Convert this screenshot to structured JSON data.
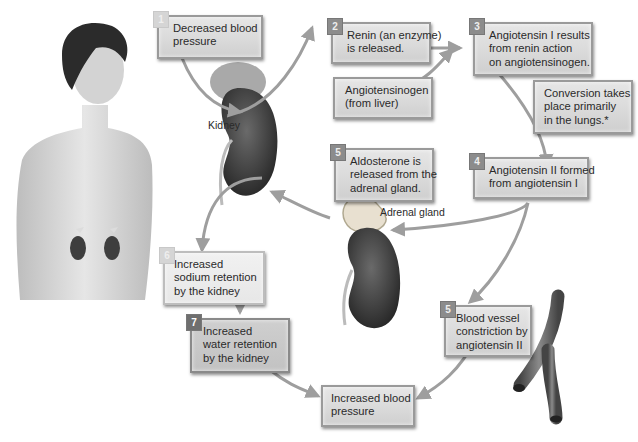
{
  "diagram": {
    "colors": {
      "box_fill": "#d9d9d9",
      "box_border": "#9a9a9a",
      "badge": "#8c8c8c",
      "arrow": "#9e9e9e",
      "text": "#2a2a2a",
      "kidney": "#3a3a3a"
    },
    "steps": [
      {
        "id": "s1",
        "number": "1",
        "lines": [
          "Decreased blood",
          "pressure"
        ]
      },
      {
        "id": "s2",
        "number": "2",
        "lines": [
          "Renin (an enzyme)",
          "is released."
        ]
      },
      {
        "id": "s_src",
        "number": "",
        "lines": [
          "Angiotensinogen",
          "(from liver)"
        ]
      },
      {
        "id": "s3",
        "number": "3",
        "lines": [
          "Angiotensin I results",
          "from renin action",
          "on angiotensinogen."
        ]
      },
      {
        "id": "s_note",
        "number": "",
        "lines": [
          "Conversion takes",
          "place primarily",
          "in the lungs.*"
        ]
      },
      {
        "id": "s4",
        "number": "4",
        "lines": [
          "Angiotensin II formed",
          "from angiotensin I"
        ]
      },
      {
        "id": "s5a",
        "number": "5",
        "lines": [
          "Aldosterone is",
          "released from the",
          "adrenal gland."
        ]
      },
      {
        "id": "s6",
        "number": "6",
        "lines": [
          "Increased",
          "sodium retention",
          "by the kidney"
        ]
      },
      {
        "id": "s7",
        "number": "7",
        "lines": [
          "Increased",
          "water retention",
          "by the kidney"
        ]
      },
      {
        "id": "s5b",
        "number": "5",
        "lines": [
          "Blood vessel",
          "constriction by",
          "angiotensin II"
        ]
      },
      {
        "id": "s_end",
        "number": "",
        "lines": [
          "Increased blood",
          "pressure"
        ]
      }
    ],
    "labels": {
      "kidney": "Kidney",
      "adrenal_gland": "Adrenal gland"
    },
    "illustrations": [
      "human-torso-with-kidneys",
      "kidney-with-renin-cells",
      "kidney-with-adrenal-gland",
      "branching-blood-vessel"
    ]
  }
}
